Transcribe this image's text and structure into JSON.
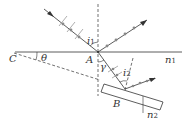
{
  "diagram": {
    "type": "physics-optics-polarization",
    "labels": {
      "C": "C",
      "theta": "θ",
      "A": "A",
      "i1": "i",
      "i1_sub": "1",
      "gamma": "γ",
      "i2": "i",
      "i2_sub": "2",
      "B": "B",
      "n1": "n",
      "n1_sub": "1",
      "n2": "n",
      "n2_sub": "2"
    },
    "colors": {
      "line": "#333333",
      "dots": "#888888",
      "ticks": "#999999"
    }
  }
}
